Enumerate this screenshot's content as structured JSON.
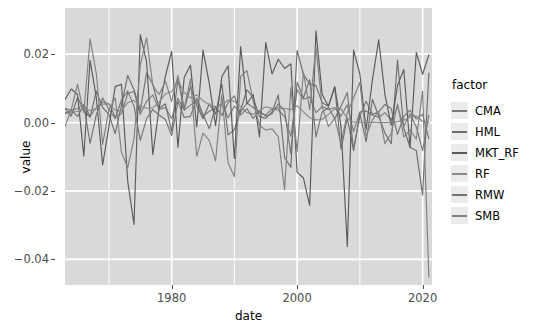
{
  "chart_data": {
    "type": "line",
    "title": "",
    "xlabel": "date",
    "ylabel": "value",
    "xlim": [
      1963,
      2021.5
    ],
    "ylim": [
      -0.0475,
      0.0335
    ],
    "xticks": [
      1980,
      2000,
      2020
    ],
    "xticklabels": [
      "1980",
      "2000",
      "2020"
    ],
    "yticks": [
      0.02,
      0.0,
      -0.02,
      -0.04
    ],
    "yticklabels": [
      "0.02",
      "0.00",
      "-0.02",
      "-0.04"
    ],
    "grid": true,
    "legend_position": "right",
    "legend_title": "factor",
    "panel_background": "#d9d9d9",
    "grid_color": "#ffffff",
    "series": [
      {
        "name": "CMA",
        "color": "#7a7a7a",
        "x": [
          1963,
          1964,
          1965,
          1966,
          1967,
          1968,
          1969,
          1970,
          1971,
          1972,
          1973,
          1974,
          1975,
          1976,
          1977,
          1978,
          1979,
          1980,
          1981,
          1982,
          1983,
          1984,
          1985,
          1986,
          1987,
          1988,
          1989,
          1990,
          1991,
          1992,
          1993,
          1994,
          1995,
          1996,
          1997,
          1998,
          1999,
          2000,
          2001,
          2002,
          2003,
          2004,
          2005,
          2006,
          2007,
          2008,
          2009,
          2010,
          2011,
          2012,
          2013,
          2014,
          2015,
          2016,
          2017,
          2018,
          2019,
          2020,
          2021
        ],
        "values": [
          0.0028,
          0.0035,
          0.0041,
          0.0052,
          0.0019,
          0.0044,
          0.0061,
          0.0055,
          0.0017,
          0.0026,
          0.0085,
          0.0091,
          0.0024,
          0.0062,
          0.0081,
          0.0038,
          0.0044,
          0.0012,
          0.0071,
          0.0036,
          0.0051,
          0.0062,
          0.0018,
          0.0033,
          0.0042,
          0.0056,
          0.0014,
          0.0048,
          0.0031,
          0.0057,
          0.0044,
          0.0029,
          0.0022,
          0.0041,
          0.0036,
          0.0018,
          -0.0041,
          0.0096,
          0.0068,
          0.0075,
          0.0029,
          0.0047,
          0.0038,
          0.0044,
          0.0019,
          0.0052,
          -0.0027,
          0.0031,
          0.0034,
          0.0022,
          0.0015,
          0.0029,
          0.0008,
          0.0047,
          -0.0011,
          0.0026,
          -0.0013,
          -0.0082,
          0.0021
        ]
      },
      {
        "name": "HML",
        "color": "#6e6e6e",
        "x": [
          1963,
          1964,
          1965,
          1966,
          1967,
          1968,
          1969,
          1970,
          1971,
          1972,
          1973,
          1974,
          1975,
          1976,
          1977,
          1978,
          1979,
          1980,
          1981,
          1982,
          1983,
          1984,
          1985,
          1986,
          1987,
          1988,
          1989,
          1990,
          1991,
          1992,
          1993,
          1994,
          1995,
          1996,
          1997,
          1998,
          1999,
          2000,
          2001,
          2002,
          2003,
          2004,
          2005,
          2006,
          2007,
          2008,
          2009,
          2010,
          2011,
          2012,
          2013,
          2014,
          2015,
          2016,
          2017,
          2018,
          2019,
          2020,
          2021
        ],
        "values": [
          0.0041,
          0.0019,
          0.0073,
          0.0036,
          0.0015,
          0.0092,
          0.0044,
          0.0024,
          -0.0032,
          0.0051,
          0.0138,
          0.0096,
          0.0034,
          0.0145,
          0.0112,
          0.0041,
          0.0055,
          -0.0025,
          0.0128,
          0.0037,
          0.0105,
          0.0049,
          0.0011,
          0.0055,
          0.0024,
          0.0113,
          -0.0036,
          -0.0021,
          0.0036,
          0.0096,
          0.0072,
          0.0018,
          0.0012,
          0.0031,
          0.0081,
          -0.0102,
          -0.0131,
          0.0211,
          0.0142,
          0.0113,
          0.0108,
          0.0058,
          0.0048,
          0.0104,
          -0.0078,
          0.0013,
          -0.0082,
          0.0026,
          -0.0056,
          0.0068,
          0.0019,
          -0.0031,
          -0.0062,
          0.0183,
          -0.0016,
          -0.0073,
          -0.0082,
          -0.0212,
          0.0145
        ]
      },
      {
        "name": "MKT_RF",
        "color": "#5a5a5a",
        "x": [
          1963,
          1964,
          1965,
          1966,
          1967,
          1968,
          1969,
          1970,
          1971,
          1972,
          1973,
          1974,
          1975,
          1976,
          1977,
          1978,
          1979,
          1980,
          1981,
          1982,
          1983,
          1984,
          1985,
          1986,
          1987,
          1988,
          1989,
          1990,
          1991,
          1992,
          1993,
          1994,
          1995,
          1996,
          1997,
          1998,
          1999,
          2000,
          2001,
          2002,
          2003,
          2004,
          2005,
          2006,
          2007,
          2008,
          2009,
          2010,
          2011,
          2012,
          2013,
          2014,
          2015,
          2016,
          2017,
          2018,
          2019,
          2020,
          2021
        ],
        "values": [
          0.0068,
          0.0098,
          0.0082,
          -0.0098,
          0.0182,
          0.0072,
          -0.0124,
          -0.0012,
          0.0105,
          0.0112,
          -0.0172,
          -0.0298,
          0.0257,
          0.0178,
          -0.0094,
          0.0042,
          0.0135,
          0.0208,
          -0.0072,
          0.0132,
          0.0168,
          -0.0013,
          0.0212,
          0.0114,
          -0.0009,
          0.0134,
          0.0166,
          -0.0105,
          0.0222,
          0.0055,
          0.0082,
          -0.0042,
          0.0234,
          0.0142,
          0.0185,
          0.0158,
          0.0172,
          -0.0145,
          -0.0162,
          -0.0242,
          0.0268,
          0.0082,
          0.0048,
          0.0105,
          -0.0012,
          -0.0362,
          0.0212,
          0.0142,
          -0.0021,
          0.0125,
          0.0242,
          0.0082,
          -0.0008,
          0.0108,
          0.0155,
          -0.0072,
          0.0205,
          0.0141,
          0.0198
        ]
      },
      {
        "name": "RF",
        "color": "#8a8a8a",
        "x": [
          1963,
          1964,
          1965,
          1966,
          1967,
          1968,
          1969,
          1970,
          1971,
          1972,
          1973,
          1974,
          1975,
          1976,
          1977,
          1978,
          1979,
          1980,
          1981,
          1982,
          1983,
          1984,
          1985,
          1986,
          1987,
          1988,
          1989,
          1990,
          1991,
          1992,
          1993,
          1994,
          1995,
          1996,
          1997,
          1998,
          1999,
          2000,
          2001,
          2002,
          2003,
          2004,
          2005,
          2006,
          2007,
          2008,
          2009,
          2010,
          2011,
          2012,
          2013,
          2014,
          2015,
          2016,
          2017,
          2018,
          2019,
          2020,
          2021
        ],
        "values": [
          0.0026,
          0.0029,
          0.0033,
          0.004,
          0.0035,
          0.0042,
          0.0054,
          0.0054,
          0.0036,
          0.0035,
          0.0058,
          0.0065,
          0.0048,
          0.0042,
          0.0043,
          0.006,
          0.0084,
          0.009,
          0.0123,
          0.0088,
          0.0072,
          0.0081,
          0.0064,
          0.0052,
          0.0046,
          0.0051,
          0.0066,
          0.0062,
          0.0046,
          0.0029,
          0.0024,
          0.0035,
          0.0046,
          0.0042,
          0.0043,
          0.0041,
          0.0038,
          0.0049,
          0.0032,
          0.0014,
          0.0008,
          0.0009,
          0.0024,
          0.004,
          0.004,
          0.0013,
          0.0001,
          0.0001,
          0.0,
          0.0001,
          0.0,
          0.0,
          0.0,
          0.0002,
          0.0007,
          0.0016,
          0.0019,
          0.0003,
          0.0
        ]
      },
      {
        "name": "RMW",
        "color": "#747474",
        "x": [
          1963,
          1964,
          1965,
          1966,
          1967,
          1968,
          1969,
          1970,
          1971,
          1972,
          1973,
          1974,
          1975,
          1976,
          1977,
          1978,
          1979,
          1980,
          1981,
          1982,
          1983,
          1984,
          1985,
          1986,
          1987,
          1988,
          1989,
          1990,
          1991,
          1992,
          1993,
          1994,
          1995,
          1996,
          1997,
          1998,
          1999,
          2000,
          2001,
          2002,
          2003,
          2004,
          2005,
          2006,
          2007,
          2008,
          2009,
          2010,
          2011,
          2012,
          2013,
          2014,
          2015,
          2016,
          2017,
          2018,
          2019,
          2020,
          2021
        ],
        "values": [
          0.0042,
          0.0036,
          0.0018,
          0.0051,
          -0.0061,
          0.0024,
          0.0072,
          0.0038,
          0.0012,
          0.0066,
          0.0092,
          0.0048,
          -0.0052,
          0.0011,
          0.0038,
          0.0022,
          0.0009,
          -0.0038,
          0.0062,
          0.0015,
          0.0018,
          0.0072,
          0.0024,
          -0.0018,
          0.0047,
          0.0021,
          0.0058,
          0.0078,
          0.0022,
          0.0041,
          0.0012,
          0.0034,
          0.0018,
          0.0026,
          0.0055,
          0.0034,
          -0.0092,
          0.0118,
          0.0072,
          0.0125,
          -0.0042,
          0.0031,
          0.0044,
          0.0011,
          0.0048,
          0.0088,
          -0.0078,
          0.0019,
          0.0062,
          0.0024,
          0.0031,
          0.0053,
          0.0041,
          -0.0035,
          0.0018,
          0.0036,
          0.0011,
          0.0024,
          -0.0048
        ]
      },
      {
        "name": "SMB",
        "color": "#808080",
        "x": [
          1963,
          1964,
          1965,
          1966,
          1967,
          1968,
          1969,
          1970,
          1971,
          1972,
          1973,
          1974,
          1975,
          1976,
          1977,
          1978,
          1979,
          1980,
          1981,
          1982,
          1983,
          1984,
          1985,
          1986,
          1987,
          1988,
          1989,
          1990,
          1991,
          1992,
          1993,
          1994,
          1995,
          1996,
          1997,
          1998,
          1999,
          2000,
          2001,
          2002,
          2003,
          2004,
          2005,
          2006,
          2007,
          2008,
          2009,
          2010,
          2011,
          2012,
          2013,
          2014,
          2015,
          2016,
          2017,
          2018,
          2019,
          2020,
          2021
        ],
        "values": [
          -0.0012,
          0.0038,
          0.0112,
          0.0028,
          0.0245,
          0.0142,
          -0.0064,
          0.0038,
          0.0072,
          -0.0086,
          -0.0132,
          -0.0048,
          0.0168,
          0.0248,
          0.0108,
          0.0082,
          0.0121,
          0.0062,
          0.0138,
          0.0042,
          0.0128,
          -0.0098,
          -0.0031,
          -0.0052,
          -0.0112,
          0.0082,
          -0.0118,
          -0.0158,
          0.0135,
          0.0152,
          0.0062,
          -0.0008,
          -0.0022,
          -0.0018,
          -0.0042,
          -0.0196,
          0.0102,
          -0.0085,
          0.0148,
          0.0038,
          0.0221,
          0.0046,
          -0.0012,
          0.0012,
          -0.0062,
          0.0028,
          0.0072,
          0.0118,
          -0.0042,
          0.0008,
          0.0032,
          -0.0062,
          -0.0032,
          0.0055,
          -0.0042,
          -0.0022,
          -0.0048,
          0.0092,
          -0.0452
        ]
      }
    ]
  },
  "legend": {
    "title": "factor",
    "items": [
      {
        "label": "CMA",
        "color": "#7a7a7a"
      },
      {
        "label": "HML",
        "color": "#6e6e6e"
      },
      {
        "label": "MKT_RF",
        "color": "#5a5a5a"
      },
      {
        "label": "RF",
        "color": "#8a8a8a"
      },
      {
        "label": "RMW",
        "color": "#747474"
      },
      {
        "label": "SMB",
        "color": "#808080"
      }
    ]
  }
}
